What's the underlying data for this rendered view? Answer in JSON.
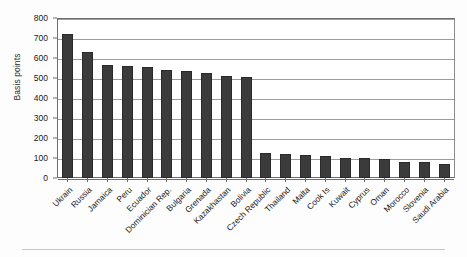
{
  "chart_data": {
    "type": "bar",
    "title": "",
    "xlabel": "",
    "ylabel": "Basis points",
    "ylim": [
      0,
      800
    ],
    "yticks": [
      0,
      100,
      200,
      300,
      400,
      500,
      600,
      700,
      800
    ],
    "grid": true,
    "legend": "none",
    "bar_color": "#3b3b3b",
    "categories": [
      "Ukrain",
      "Russia",
      "Jamaica",
      "Peru",
      "Ecuador",
      "Dominician Rep.",
      "Bulgaria",
      "Grenada",
      "Kazakhastan",
      "Bolivia",
      "Czech Republic",
      "Thailand",
      "Malta",
      "Cook Is",
      "Kuwait",
      "Cyprus",
      "Oman",
      "Morocco",
      "Slovenia",
      "Saudi Arabia"
    ],
    "values": [
      720,
      632,
      565,
      560,
      555,
      540,
      535,
      525,
      512,
      505,
      123,
      120,
      117,
      112,
      100,
      98,
      97,
      82,
      80,
      70
    ]
  },
  "bottom_strip": {
    "cells": [
      "",
      "",
      "",
      "",
      "",
      "",
      ""
    ]
  }
}
